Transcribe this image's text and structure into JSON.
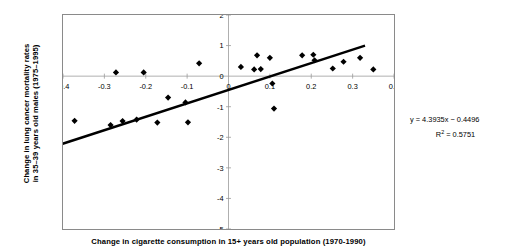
{
  "chart_data": {
    "type": "scatter",
    "title": "",
    "xlabel": "Change in cigarette consumption in 15+ years old population (1970-1990)",
    "ylabel_line1": "Change in lung cancer mortality rates",
    "ylabel_line2": "in 35–39 years old males (1975–1995)",
    "xlim": [
      -0.4,
      0.4
    ],
    "ylim": [
      -5,
      2
    ],
    "xticks": [
      -0.4,
      -0.3,
      -0.2,
      -0.1,
      0,
      0.1,
      0.2,
      0.3,
      0.4
    ],
    "xticklabels": [
      "-0.4",
      "-0.3",
      "-0.2",
      "-0.1",
      "0",
      "0.1",
      "0.2",
      "0.3",
      "0.4"
    ],
    "yticks": [
      2,
      1,
      0,
      -1,
      -2,
      -3,
      -4,
      -5
    ],
    "yticklabels": [
      "2",
      "1",
      "0",
      "-1",
      "-2",
      "-3",
      "-4",
      "-5"
    ],
    "grid": false,
    "legend": null,
    "marker": "diamond",
    "marker_color": "#000000",
    "trendline_color": "#000000",
    "points": [
      {
        "x": -0.437,
        "y": -4.62
      },
      {
        "x": -0.372,
        "y": -1.46
      },
      {
        "x": -0.285,
        "y": -1.6
      },
      {
        "x": -0.272,
        "y": 0.12
      },
      {
        "x": -0.256,
        "y": -1.47
      },
      {
        "x": -0.222,
        "y": -1.42
      },
      {
        "x": -0.205,
        "y": 0.12
      },
      {
        "x": -0.172,
        "y": -1.52
      },
      {
        "x": -0.146,
        "y": -0.7
      },
      {
        "x": -0.104,
        "y": -0.86
      },
      {
        "x": -0.098,
        "y": -1.51
      },
      {
        "x": -0.071,
        "y": 0.42
      },
      {
        "x": 0.03,
        "y": 0.3
      },
      {
        "x": 0.062,
        "y": 0.22
      },
      {
        "x": 0.069,
        "y": 0.68
      },
      {
        "x": 0.078,
        "y": 0.23
      },
      {
        "x": 0.1,
        "y": 0.6
      },
      {
        "x": 0.106,
        "y": -0.24
      },
      {
        "x": 0.11,
        "y": -1.06
      },
      {
        "x": 0.178,
        "y": 0.68
      },
      {
        "x": 0.205,
        "y": 0.7
      },
      {
        "x": 0.208,
        "y": 0.52
      },
      {
        "x": 0.252,
        "y": 0.25
      },
      {
        "x": 0.278,
        "y": 0.47
      },
      {
        "x": 0.318,
        "y": 0.6
      },
      {
        "x": 0.35,
        "y": 0.22
      }
    ],
    "trendline": {
      "equation": "y = 4.3935x − 0.4496",
      "r2_label": "R² = 0.5751",
      "r2_prefix": "R",
      "r2_sup": "2",
      "r2_value": " = 0.5751",
      "slope": 4.3935,
      "intercept": -0.4496,
      "r2": 0.5751,
      "x_start": -0.425,
      "x_end": 0.33
    }
  }
}
